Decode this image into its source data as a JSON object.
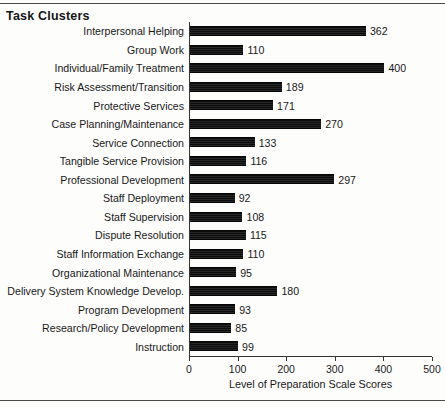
{
  "figure": {
    "title": "Task Clusters",
    "top_rule": true,
    "bottom_rule": true
  },
  "chart_data": {
    "type": "bar",
    "orientation": "horizontal",
    "title": "Task Clusters",
    "xlabel": "Level of Preparation Scale Scores",
    "ylabel": "",
    "xlim": [
      0,
      500
    ],
    "xticks": [
      0,
      100,
      200,
      300,
      400,
      500
    ],
    "xtick_labels": [
      "0",
      "100",
      "200",
      "300",
      "400",
      "500"
    ],
    "grid": false,
    "legend": false,
    "bar_color": "#111111",
    "value_labels": true,
    "categories": [
      "Interpersonal Helping",
      "Group Work",
      "Individual/Family Treatment",
      "Risk Assessment/Transition",
      "Protective Services",
      "Case Planning/Maintenance",
      "Service Connection",
      "Tangible Service Provision",
      "Professional Development",
      "Staff Deployment",
      "Staff Supervision",
      "Dispute Resolution",
      "Staff Information Exchange",
      "Organizational Maintenance",
      "Delivery System Knowledge Develop.",
      "Program Development",
      "Research/Policy Development",
      "Instruction"
    ],
    "values": [
      362,
      110,
      400,
      189,
      171,
      270,
      133,
      116,
      297,
      92,
      108,
      115,
      110,
      95,
      180,
      93,
      85,
      99
    ]
  }
}
